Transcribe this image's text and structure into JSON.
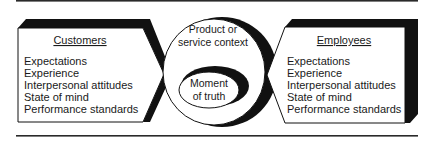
{
  "diagram": {
    "left_panel": {
      "title": "Customers",
      "items": [
        "Expectations",
        "Experience",
        "Interpersonal attitudes",
        "State of mind",
        "Performance standards"
      ]
    },
    "center": {
      "outer_label_line1": "Product or",
      "outer_label_line2": "service context",
      "inner_label_line1": "Moment",
      "inner_label_line2": "of truth"
    },
    "right_panel": {
      "title": "Employees",
      "items": [
        "Expectations",
        "Experience",
        "Interpersonal attitudes",
        "State of mind",
        "Performance standards"
      ]
    },
    "colors": {
      "ink": "#1a1a1a",
      "background": "#ffffff"
    }
  }
}
